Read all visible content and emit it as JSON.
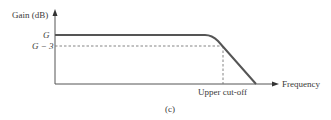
{
  "diagram": {
    "y_axis_label": "Gain (dB)",
    "x_axis_label": "Frequency",
    "level_labels": {
      "gain": "G",
      "minus3": "G − 3"
    },
    "cutoff_label": "Upper cut-off",
    "caption": "(c)",
    "colors": {
      "curve": "#555555",
      "axis": "#555555",
      "dashed": "#777777",
      "text": "#3a3a3a"
    }
  }
}
